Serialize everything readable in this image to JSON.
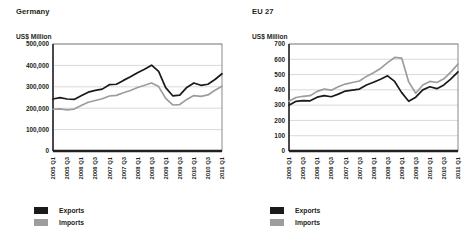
{
  "figure": {
    "panels": [
      {
        "title": "Germany",
        "axis_unit": "US$ Million",
        "legend": [
          {
            "label": "Exports",
            "color": "#1a1a1a"
          },
          {
            "label": "Imports",
            "color": "#9d9d9d"
          }
        ]
      },
      {
        "title": "EU 27",
        "axis_unit": "US$ Million",
        "legend": [
          {
            "label": "Exports",
            "color": "#1a1a1a"
          },
          {
            "label": "Imports",
            "color": "#9d9d9d"
          }
        ]
      }
    ]
  },
  "chart_data": [
    {
      "type": "line",
      "title": "Germany",
      "xlabel": "",
      "ylabel": "US$ Million",
      "ylim": [
        0,
        500000
      ],
      "yticks": [
        0,
        100000,
        200000,
        300000,
        400000,
        500000
      ],
      "ytick_labels": [
        "0",
        "100,000",
        "200,000",
        "300,000",
        "400,000",
        "500,000"
      ],
      "grid": true,
      "legend_position": "below-left",
      "x": [
        "2005 Q1",
        "2005 Q2",
        "2005 Q3",
        "2005 Q4",
        "2006 Q1",
        "2006 Q2",
        "2006 Q3",
        "2006 Q4",
        "2007 Q1",
        "2007 Q2",
        "2007 Q3",
        "2007 Q4",
        "2008 Q1",
        "2008 Q2",
        "2008 Q3",
        "2008 Q4",
        "2009 Q1",
        "2009 Q2",
        "2009 Q3",
        "2009 Q4",
        "2010 Q1",
        "2010 Q2",
        "2010 Q3",
        "2010 Q4",
        "2011 Q1"
      ],
      "xtick_labels": [
        "2005 Q1",
        "2005 Q3",
        "2006 Q1",
        "2006 Q3",
        "2007 Q1",
        "2007 Q3",
        "2008 Q1",
        "2008 Q3",
        "2009 Q1",
        "2009 Q3",
        "2010 Q1",
        "2010 Q3",
        "2011 Q1"
      ],
      "series": [
        {
          "name": "Exports",
          "color": "#1a1a1a",
          "values": [
            243000,
            249000,
            243000,
            241000,
            258000,
            275000,
            283000,
            289000,
            310000,
            312000,
            330000,
            347000,
            366000,
            382000,
            401000,
            372000,
            296000,
            258000,
            261000,
            297000,
            318000,
            307000,
            312000,
            334000,
            361000
          ]
        },
        {
          "name": "Imports",
          "color": "#9d9d9d",
          "values": [
            195000,
            197000,
            192000,
            196000,
            213000,
            228000,
            236000,
            244000,
            257000,
            260000,
            272000,
            283000,
            297000,
            307000,
            318000,
            301000,
            246000,
            215000,
            217000,
            241000,
            259000,
            255000,
            262000,
            284000,
            303000
          ]
        }
      ]
    },
    {
      "type": "line",
      "title": "EU 27",
      "xlabel": "",
      "ylabel": "US$ Million",
      "ylim": [
        0,
        700
      ],
      "yticks": [
        0,
        100,
        200,
        300,
        400,
        500,
        600,
        700
      ],
      "ytick_labels": [
        "0",
        "100",
        "200",
        "300",
        "400",
        "500",
        "600",
        "700"
      ],
      "grid": true,
      "legend_position": "below-left",
      "x": [
        "2005 Q1",
        "2005 Q2",
        "2005 Q3",
        "2005 Q4",
        "2006 Q1",
        "2006 Q2",
        "2006 Q3",
        "2006 Q4",
        "2007 Q1",
        "2007 Q2",
        "2007 Q3",
        "2007 Q4",
        "2008 Q1",
        "2008 Q2",
        "2008 Q3",
        "2008 Q4",
        "2009 Q1",
        "2009 Q2",
        "2009 Q3",
        "2009 Q4",
        "2010 Q1",
        "2010 Q2",
        "2010 Q3",
        "2010 Q4",
        "2011 Q1"
      ],
      "xtick_labels": [
        "2005 Q1",
        "2005 Q3",
        "2006 Q1",
        "2006 Q3",
        "2007 Q1",
        "2007 Q3",
        "2008 Q1",
        "2008 Q3",
        "2009 Q1",
        "2009 Q3",
        "2010 Q1",
        "2010 Q3",
        "2011 Q1"
      ],
      "series": [
        {
          "name": "Exports",
          "color": "#1a1a1a",
          "values": [
            300,
            325,
            330,
            328,
            352,
            362,
            355,
            372,
            392,
            398,
            405,
            432,
            450,
            470,
            492,
            455,
            382,
            325,
            352,
            400,
            420,
            408,
            432,
            472,
            518
          ]
        },
        {
          "name": "Imports",
          "color": "#9d9d9d",
          "values": [
            325,
            350,
            358,
            362,
            390,
            405,
            398,
            420,
            438,
            448,
            458,
            488,
            512,
            540,
            578,
            612,
            608,
            452,
            378,
            432,
            455,
            448,
            472,
            518,
            568
          ]
        }
      ]
    }
  ]
}
